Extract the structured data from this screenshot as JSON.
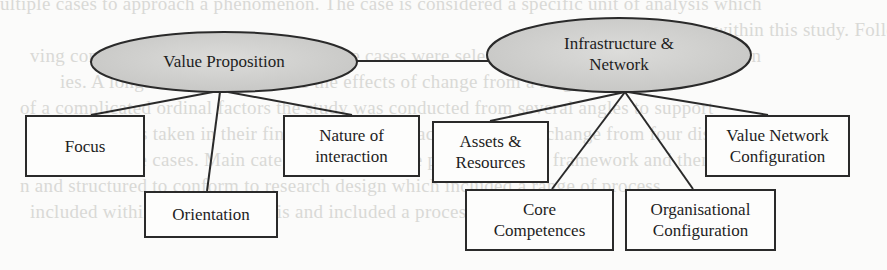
{
  "diagram": {
    "type": "concept-hierarchy",
    "colors": {
      "ellipse_fill": "#cfcfcd",
      "stroke": "#2a2a2a",
      "box_fill": "#fdfdfc",
      "background": "#fbfbfa"
    },
    "hubs": [
      {
        "id": "value-proposition",
        "label": "Value Proposition",
        "children": [
          {
            "id": "focus",
            "label": "Focus"
          },
          {
            "id": "orientation",
            "label": "Orientation"
          },
          {
            "id": "nature-of-interaction",
            "label": "Nature of interaction"
          }
        ]
      },
      {
        "id": "infrastructure-network",
        "label_line1": "Infrastructure &",
        "label_line2": "Network",
        "children": [
          {
            "id": "assets-resources",
            "label_line1": "Assets &",
            "label_line2": "Resources"
          },
          {
            "id": "core-competences",
            "label_line1": "Core",
            "label_line2": "Competences"
          },
          {
            "id": "organisational-configuration",
            "label_line1": "Organisational",
            "label_line2": "Configuration"
          },
          {
            "id": "value-network-configuration",
            "label_line1": "Value Network",
            "label_line2": "Configuration"
          }
        ]
      }
    ],
    "edges": [
      [
        "value-proposition",
        "infrastructure-network"
      ],
      [
        "value-proposition",
        "focus"
      ],
      [
        "value-proposition",
        "orientation"
      ],
      [
        "value-proposition",
        "nature-of-interaction"
      ],
      [
        "infrastructure-network",
        "assets-resources"
      ],
      [
        "infrastructure-network",
        "core-competences"
      ],
      [
        "infrastructure-network",
        "organisational-configuration"
      ],
      [
        "infrastructure-network",
        "value-network-configuration"
      ]
    ]
  },
  "background_text": [
    "                                      ultiple cases to approach a phenomenon. The case is considered a specific unit of analysis which",
    "e a new methodology within this study. Following this and the research questions and logic",
    "ving  considered the  approaches  taken, the cases were selected to ensure that the organisation",
    "ies. A  longitudinal study isolate the effects of change from a single company",
    "of  a  complicated  ordinal  factors  the  study  was  conducted  from  several  angles  to  support",
    "s  taken  in  their  findings.  The  approach  suggested  a  change  from  four  distinct",
    "from the cases.  Main categories refer to the pre-determined framework and  then  tested  the",
    "n  and  structured  to  conform  to  research  design  which  included  a  range  of  process",
    "                     included  within  the  case  analysis  and  included  a  process  of  the"
  ]
}
